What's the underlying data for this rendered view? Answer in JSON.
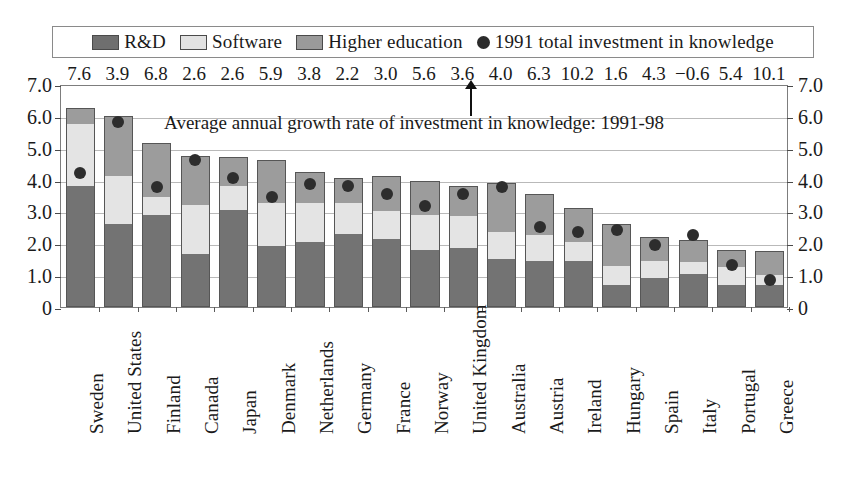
{
  "legend": {
    "items": [
      {
        "label": "R&D",
        "marker": "square-swatch-dark",
        "color": "#737373"
      },
      {
        "label": "Software",
        "marker": "square-swatch-light",
        "color": "#e4e4e4"
      },
      {
        "label": "Higher education",
        "marker": "square-swatch-mid",
        "color": "#9c9c9c"
      },
      {
        "label": "1991 total investment in knowledge",
        "marker": "circle-marker",
        "color": "#2d2d2d"
      }
    ]
  },
  "annotation": "Average annual growth rate of investment in knowledge: 1991-98",
  "axis": {
    "left_ticks": [
      "7.0",
      "6.0",
      "5.0",
      "4.0",
      "3.0",
      "2.0",
      "1.0",
      "0"
    ],
    "right_ticks": [
      "7.0",
      "6.0",
      "5.0",
      "4.0",
      "3.0",
      "2.0",
      "1.0",
      "0"
    ]
  },
  "chart_data": {
    "type": "bar",
    "title": "",
    "subtitle": "Average annual growth rate of investment in knowledge: 1991-98",
    "xlabel": "",
    "ylabel": "",
    "ylim": [
      0,
      7
    ],
    "yticks": [
      0,
      1,
      2,
      3,
      4,
      5,
      6,
      7
    ],
    "grid": true,
    "stacked": true,
    "legend_position": "top",
    "categories": [
      "Sweden",
      "United States",
      "Finland",
      "Canada",
      "Japan",
      "Denmark",
      "Netherlands",
      "Germany",
      "France",
      "Norway",
      "United Kingdom",
      "Australia",
      "Austria",
      "Ireland",
      "Hungary",
      "Spain",
      "Italy",
      "Portugal",
      "Greece"
    ],
    "series": [
      {
        "name": "R&D",
        "values": [
          3.8,
          2.6,
          2.9,
          1.65,
          3.05,
          1.9,
          2.05,
          2.3,
          2.15,
          1.8,
          1.85,
          1.5,
          1.45,
          1.45,
          0.7,
          0.9,
          1.05,
          0.7,
          0.7
        ]
      },
      {
        "name": "Software",
        "values": [
          1.95,
          1.5,
          0.55,
          1.55,
          0.75,
          1.35,
          1.2,
          0.95,
          0.85,
          1.1,
          1.0,
          0.85,
          0.8,
          0.6,
          0.6,
          0.55,
          0.35,
          0.55,
          0.3
        ]
      },
      {
        "name": "Higher education",
        "values": [
          0.5,
          1.9,
          1.7,
          1.55,
          0.9,
          1.35,
          1.0,
          0.8,
          1.1,
          1.05,
          0.95,
          1.55,
          1.3,
          1.05,
          1.3,
          0.75,
          0.7,
          0.55,
          0.75
        ]
      }
    ],
    "dots": {
      "name": "1991 total investment in knowledge",
      "values": [
        4.4,
        6.0,
        3.95,
        4.8,
        4.25,
        3.65,
        4.05,
        4.0,
        3.75,
        3.35,
        3.75,
        3.95,
        2.7,
        2.55,
        2.6,
        2.15,
        2.45,
        1.5,
        1.05
      ]
    },
    "growth_rates": {
      "name": "Average annual growth rate of investment in knowledge: 1991-98",
      "values": [
        "7.6",
        "3.9",
        "6.8",
        "2.6",
        "2.6",
        "5.9",
        "3.8",
        "2.2",
        "3.0",
        "5.6",
        "3.6",
        "4.0",
        "6.3",
        "10.2",
        "1.6",
        "4.3",
        "−0.6",
        "5.4",
        "10.1"
      ]
    }
  }
}
